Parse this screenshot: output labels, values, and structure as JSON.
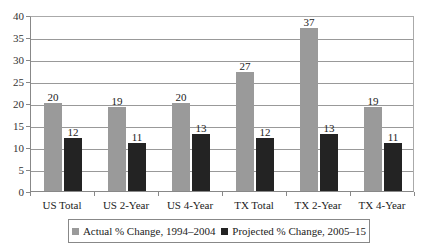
{
  "chart_data": {
    "type": "bar",
    "title": "",
    "xlabel": "",
    "ylabel": "",
    "ylim": [
      0,
      40
    ],
    "yticks": [
      0,
      5,
      10,
      15,
      20,
      25,
      30,
      35,
      40
    ],
    "grid": true,
    "legend_position": "bottom",
    "categories": [
      "US Total",
      "US 2-Year",
      "US 4-Year",
      "TX Total",
      "TX 2-Year",
      "TX 4-Year"
    ],
    "series": [
      {
        "name": "Actual % Change, 1994–2004",
        "color": "#9a9a9a",
        "values": [
          20,
          19,
          20,
          27,
          37,
          19
        ]
      },
      {
        "name": "Projected % Change, 2005–15",
        "color": "#232323",
        "values": [
          12,
          11,
          13,
          12,
          13,
          11
        ]
      }
    ]
  }
}
